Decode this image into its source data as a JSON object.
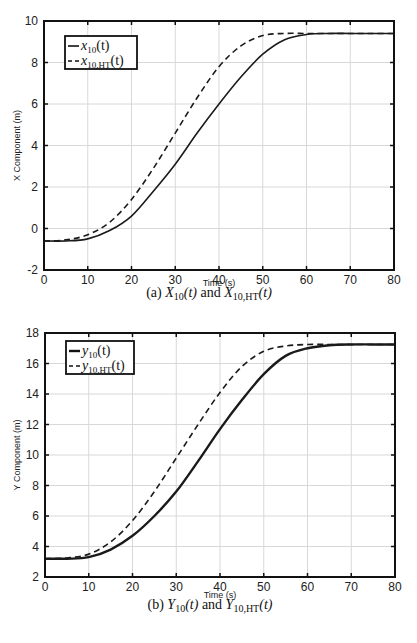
{
  "chart_data": [
    {
      "type": "line",
      "title": "",
      "caption": "(a) X10(t) and X10,HT(t)",
      "xlabel": "Time (s)",
      "ylabel": "X Component (m)",
      "xlim": [
        0,
        80
      ],
      "ylim": [
        -2,
        10
      ],
      "xticks": [
        0,
        10,
        20,
        30,
        40,
        50,
        60,
        70,
        80
      ],
      "yticks": [
        -2,
        0,
        2,
        4,
        6,
        8,
        10
      ],
      "grid": true,
      "legend_position": "upper left",
      "x": [
        0,
        5,
        10,
        15,
        20,
        25,
        30,
        35,
        40,
        45,
        50,
        55,
        60,
        65,
        70,
        75,
        80
      ],
      "series": [
        {
          "name": "x10(t)",
          "style": "solid",
          "values": [
            -0.6,
            -0.6,
            -0.5,
            -0.1,
            0.6,
            1.8,
            3.1,
            4.6,
            6.0,
            7.3,
            8.4,
            9.1,
            9.35,
            9.4,
            9.4,
            9.4,
            9.4
          ]
        },
        {
          "name": "x10,HT(t)",
          "style": "dashed",
          "values": [
            -0.6,
            -0.55,
            -0.3,
            0.3,
            1.4,
            2.9,
            4.6,
            6.3,
            7.8,
            8.8,
            9.3,
            9.4,
            9.4,
            9.4,
            9.4,
            9.4,
            9.4
          ]
        }
      ]
    },
    {
      "type": "line",
      "title": "",
      "caption": "(b) Y10(t) and Y10,HT(t)",
      "xlabel": "Time (s)",
      "ylabel": "Y Component (m)",
      "xlim": [
        0,
        80
      ],
      "ylim": [
        2,
        18
      ],
      "xticks": [
        0,
        10,
        20,
        30,
        40,
        50,
        60,
        70,
        80
      ],
      "yticks": [
        2,
        4,
        6,
        8,
        10,
        12,
        14,
        16,
        18
      ],
      "grid": true,
      "legend_position": "upper left",
      "x": [
        0,
        5,
        10,
        15,
        20,
        25,
        30,
        35,
        40,
        45,
        50,
        55,
        60,
        65,
        70,
        75,
        80
      ],
      "series": [
        {
          "name": "y10(t)",
          "style": "solid",
          "values": [
            3.2,
            3.2,
            3.3,
            3.8,
            4.7,
            6.0,
            7.6,
            9.6,
            11.7,
            13.6,
            15.3,
            16.5,
            17.0,
            17.2,
            17.25,
            17.25,
            17.25
          ]
        },
        {
          "name": "y10,HT(t)",
          "style": "dashed",
          "values": [
            3.2,
            3.25,
            3.5,
            4.3,
            5.7,
            7.6,
            9.8,
            12.0,
            14.1,
            15.8,
            16.8,
            17.15,
            17.25,
            17.25,
            17.25,
            17.25,
            17.25
          ]
        }
      ]
    }
  ],
  "captions": {
    "a": {
      "label": "(a)",
      "sym1": "X",
      "sub1": "10",
      "arg": "(t)",
      "and": "and",
      "sym2": "X",
      "sub2": "10,HT"
    },
    "b": {
      "label": "(b)",
      "sym1": "Y",
      "sub1": "10",
      "arg": "(t)",
      "and": "and",
      "sym2": "Y",
      "sub2": "10,HT"
    }
  },
  "legends": {
    "a": [
      {
        "sym": "x",
        "sub": "10",
        "arg": "(t)"
      },
      {
        "sym": "x",
        "sub": "10,HT",
        "arg": "(t)"
      }
    ],
    "b": [
      {
        "sym": "y",
        "sub": "10",
        "arg": "(t)"
      },
      {
        "sym": "y",
        "sub": "10,HT",
        "arg": "(t)"
      }
    ]
  }
}
